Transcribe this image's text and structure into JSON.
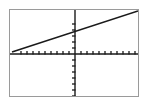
{
  "app": {
    "type": "graphing-calculator-plot",
    "background_color": "#ffffff",
    "frame_color": "#9a9a9a",
    "axis_color": "#1a1a1a",
    "line_color": "#1a1a1a"
  },
  "frame": {
    "x": 9,
    "y": 9,
    "width": 130,
    "height": 88
  },
  "chart_data": {
    "type": "line",
    "title": "",
    "subtitle": "",
    "xlabel": "",
    "ylabel": "",
    "grid": false,
    "legend": null,
    "legend_position": "none",
    "axes": {
      "x_axis_pixel_y": 44,
      "y_axis_pixel_x": 65,
      "tick_spacing_px": 6,
      "tick_length_px": 3,
      "x_tick_count_left": 9,
      "x_tick_count_right": 10,
      "y_tick_count_above": 5,
      "y_tick_count_below": 7,
      "xlim": [
        -11,
        11
      ],
      "ylim": [
        -7.5,
        7.5
      ],
      "x_scale_per_tick": 1,
      "y_scale_per_tick": 1
    },
    "series": [
      {
        "name": "line",
        "kind": "straight-line",
        "slope": 0.3,
        "intercept": 3.5,
        "color": "#1a1a1a",
        "stroke_width": 1.6,
        "pixel_start": {
          "x": 2,
          "y": 42
        },
        "pixel_end": {
          "x": 128,
          "y": 1
        },
        "x": [
          -10.5,
          10.5
        ],
        "y": [
          0.35,
          6.65
        ]
      }
    ],
    "annotations": []
  }
}
